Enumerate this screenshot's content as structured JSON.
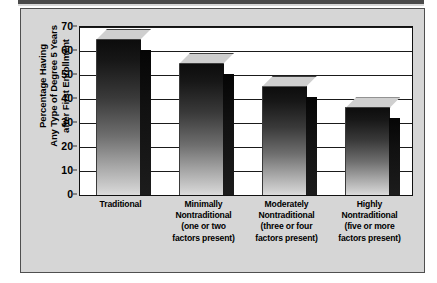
{
  "chart_data": {
    "type": "bar",
    "title": "",
    "xlabel": "",
    "ylabel": "Percentage Having Any Type of Degree 5 Years after First Enrollment",
    "ylim": [
      0,
      70
    ],
    "ytick_step": 10,
    "yticks": [
      70,
      60,
      50,
      40,
      30,
      20,
      10,
      0
    ],
    "grid": true,
    "legend": false,
    "style": "3d-bar",
    "categories": [
      "Traditional",
      "Minimally Nontraditional (one or two factors present)",
      "Moderately Nontraditional (three or four factors present)",
      "Highly Nontraditional (five or more factors present)"
    ],
    "category_lines": [
      [
        "Traditional"
      ],
      [
        "Minimally",
        "Nontraditional",
        "(one or two",
        "factors present)"
      ],
      [
        "Moderately",
        "Nontraditional",
        "(three or four",
        "factors present)"
      ],
      [
        "Highly",
        "Nontraditional",
        "(five or more",
        "factors present)"
      ]
    ],
    "values": [
      65,
      55,
      45.5,
      36.5
    ]
  },
  "axis": {
    "y_title_lines": [
      "Percentage Having",
      "Any Type of Degree 5 Years",
      "after First Enrollment"
    ],
    "tick_labels": [
      "70",
      "60",
      "50",
      "40",
      "30",
      "20",
      "10",
      "0"
    ]
  },
  "colors": {
    "panel_background": "#d6d6d6",
    "plot_background": "#ffffff",
    "bar_dark": "#0c0c0c",
    "bar_light": "#dcdcdc",
    "bar_side": "#111111",
    "bar_top": "#cfcfcf",
    "gridline": "#1a1a1a",
    "frame": "#4f4f4f",
    "text": "#000000"
  }
}
